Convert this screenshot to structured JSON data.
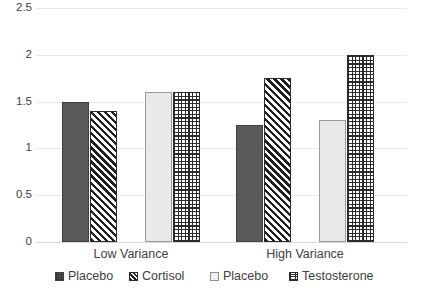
{
  "chart_data": {
    "type": "bar",
    "title": "",
    "xlabel": "",
    "ylabel": "",
    "ylim": [
      0,
      2.5
    ],
    "ytick_labels": [
      "0",
      "0.5",
      "1",
      "1.5",
      "2",
      "2.5"
    ],
    "ytick_values": [
      0,
      0.5,
      1,
      1.5,
      2,
      2.5
    ],
    "grid": true,
    "legend_position": "bottom",
    "categories": [
      "Low Variance",
      "High Variance"
    ],
    "series": [
      {
        "name": "Placebo",
        "pattern": "solid-dark-gray",
        "color": "#595959",
        "values": [
          1.5,
          1.25
        ]
      },
      {
        "name": "Cortisol",
        "pattern": "diagonal-hatch",
        "color": "#1f1f1f",
        "values": [
          1.4,
          1.75
        ]
      },
      {
        "name": "Placebo",
        "pattern": "solid-light-gray",
        "color": "#e9e9e9",
        "values": [
          1.6,
          1.3
        ]
      },
      {
        "name": "Testosterone",
        "pattern": "grid-crosshatch",
        "color": "#2b2b2b",
        "values": [
          1.6,
          2.0
        ]
      }
    ]
  },
  "axis": {
    "ticks": [
      {
        "label": "2.5",
        "value": 2.5
      },
      {
        "label": "2",
        "value": 2
      },
      {
        "label": "1.5",
        "value": 1.5
      },
      {
        "label": "1",
        "value": 1
      },
      {
        "label": "0.5",
        "value": 0.5
      },
      {
        "label": "0",
        "value": 0
      }
    ]
  },
  "categories": [
    {
      "label": "Low Variance"
    },
    {
      "label": "High Variance"
    }
  ],
  "legend": {
    "items": [
      {
        "label": "Placebo",
        "swatch": "solid-dark-gray-swatch"
      },
      {
        "label": "Cortisol",
        "swatch": "diagonal-hatch-swatch"
      },
      {
        "label": "Placebo",
        "swatch": "solid-light-gray-swatch"
      },
      {
        "label": "Testosterone",
        "swatch": "grid-crosshatch-swatch"
      }
    ]
  },
  "colors": {
    "series_dark_gray": "#595959",
    "series_light_gray": "#e9e9e9",
    "hatch_black": "#1f1f1f",
    "gridline": "#e8e8e8",
    "text": "#404040",
    "background": "#ffffff"
  }
}
